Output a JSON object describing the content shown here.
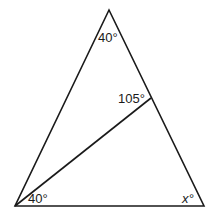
{
  "diagram": {
    "type": "triangle-with-cevian",
    "stroke_color": "#1a1a1a",
    "background": "#ffffff",
    "vertices": {
      "top": [
        109,
        10
      ],
      "bottom_left": [
        15,
        206
      ],
      "bottom_right": [
        204,
        206
      ]
    },
    "cevian": {
      "from": [
        15,
        206
      ],
      "to": [
        151,
        98
      ]
    },
    "labels": {
      "top_angle": "40°",
      "cevian_angle": "105°",
      "bottom_left_angle": "40°",
      "bottom_right_angle": "x°"
    }
  }
}
